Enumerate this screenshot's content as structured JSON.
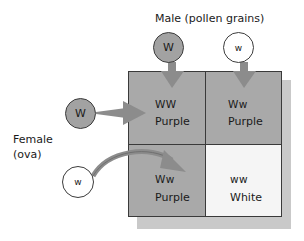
{
  "male_label": "Male (pollen grains)",
  "female_label_line1": "Female",
  "female_label_line2": "(ova)",
  "male_gametes": [
    {
      "allele": "W",
      "fill": "#a2a2a2"
    },
    {
      "allele": "w",
      "fill": "#ffffff"
    }
  ],
  "female_gametes": [
    {
      "allele": "W",
      "fill": "#a2a2a2"
    },
    {
      "allele": "w",
      "fill": "#ffffff"
    }
  ],
  "cells": [
    {
      "genotype": "WW",
      "phenotype": "Purple",
      "fill": "#a9a9a9"
    },
    {
      "genotype": "Ww",
      "phenotype": "Purple",
      "fill": "#a9a9a9"
    },
    {
      "genotype": "Ww",
      "phenotype": "Purple",
      "fill": "#a9a9a9"
    },
    {
      "genotype": "ww",
      "phenotype": "White",
      "fill": "#f5f5f5"
    }
  ],
  "colors": {
    "arrow": "#8c8c8c",
    "shadow": "#c9c9c9",
    "border": "#3a3a3a"
  }
}
